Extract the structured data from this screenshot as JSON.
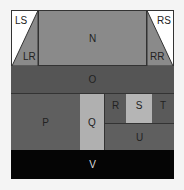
{
  "diagram": {
    "regions": {
      "LS": {
        "label": "LS",
        "color": "#ffffff"
      },
      "LR": {
        "label": "LR",
        "color": "#8a8a8a"
      },
      "N": {
        "label": "N",
        "color": "#8a8a8a"
      },
      "RS": {
        "label": "RS",
        "color": "#ffffff"
      },
      "RR": {
        "label": "RR",
        "color": "#8a8a8a"
      },
      "O": {
        "label": "O",
        "color": "#555555"
      },
      "P": {
        "label": "P",
        "color": "#5f5f5f"
      },
      "Q": {
        "label": "Q",
        "color": "#b0b0b0"
      },
      "R": {
        "label": "R",
        "color": "#5a5a5a"
      },
      "S": {
        "label": "S",
        "color": "#b5b5b5"
      },
      "T": {
        "label": "T",
        "color": "#5a5a5a"
      },
      "U": {
        "label": "U",
        "color": "#5f5f5f"
      },
      "V": {
        "label": "V",
        "color": "#050505"
      }
    }
  }
}
